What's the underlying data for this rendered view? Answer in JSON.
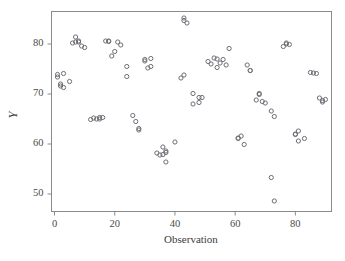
{
  "chart_data": {
    "type": "scatter",
    "title": "",
    "xlabel": "Observation",
    "ylabel": "Y",
    "xlim": [
      -1,
      92
    ],
    "ylim": [
      46.5,
      86.5
    ],
    "xticks": [
      0,
      20,
      40,
      60,
      80
    ],
    "yticks": [
      50,
      60,
      70,
      80
    ],
    "grid": false,
    "legend": null,
    "marker": "open-circle",
    "marker_color": "#6e6e76",
    "points": [
      {
        "x": 1,
        "y": 73.9
      },
      {
        "x": 1,
        "y": 73.4
      },
      {
        "x": 2,
        "y": 72.0
      },
      {
        "x": 2,
        "y": 71.6
      },
      {
        "x": 3,
        "y": 74.1
      },
      {
        "x": 3,
        "y": 71.3
      },
      {
        "x": 5,
        "y": 72.5
      },
      {
        "x": 6,
        "y": 80.2
      },
      {
        "x": 7,
        "y": 81.4
      },
      {
        "x": 7,
        "y": 80.4
      },
      {
        "x": 8,
        "y": 80.4
      },
      {
        "x": 8,
        "y": 80.6
      },
      {
        "x": 9,
        "y": 79.6
      },
      {
        "x": 10,
        "y": 79.3
      },
      {
        "x": 12,
        "y": 64.9
      },
      {
        "x": 13,
        "y": 65.2
      },
      {
        "x": 14,
        "y": 65.0
      },
      {
        "x": 15,
        "y": 65.0
      },
      {
        "x": 15,
        "y": 65.3
      },
      {
        "x": 16,
        "y": 65.3
      },
      {
        "x": 17,
        "y": 80.6
      },
      {
        "x": 18,
        "y": 80.5
      },
      {
        "x": 18,
        "y": 80.6
      },
      {
        "x": 19,
        "y": 77.6
      },
      {
        "x": 20,
        "y": 78.5
      },
      {
        "x": 21,
        "y": 80.4
      },
      {
        "x": 22,
        "y": 79.8
      },
      {
        "x": 24,
        "y": 75.5
      },
      {
        "x": 24,
        "y": 73.5
      },
      {
        "x": 26,
        "y": 65.7
      },
      {
        "x": 27,
        "y": 64.5
      },
      {
        "x": 28,
        "y": 63.1
      },
      {
        "x": 28,
        "y": 62.8
      },
      {
        "x": 30,
        "y": 76.9
      },
      {
        "x": 30,
        "y": 76.6
      },
      {
        "x": 31,
        "y": 75.2
      },
      {
        "x": 32,
        "y": 77.1
      },
      {
        "x": 32,
        "y": 75.5
      },
      {
        "x": 34,
        "y": 58.2
      },
      {
        "x": 35,
        "y": 57.8
      },
      {
        "x": 36,
        "y": 59.4
      },
      {
        "x": 36,
        "y": 57.9
      },
      {
        "x": 37,
        "y": 58.6
      },
      {
        "x": 37,
        "y": 58.3
      },
      {
        "x": 37,
        "y": 56.4
      },
      {
        "x": 40,
        "y": 60.4
      },
      {
        "x": 42,
        "y": 73.2
      },
      {
        "x": 43,
        "y": 85.2
      },
      {
        "x": 43,
        "y": 84.7
      },
      {
        "x": 43,
        "y": 73.8
      },
      {
        "x": 44,
        "y": 84.2
      },
      {
        "x": 46,
        "y": 70.1
      },
      {
        "x": 46,
        "y": 68.0
      },
      {
        "x": 48,
        "y": 69.3
      },
      {
        "x": 48,
        "y": 68.3
      },
      {
        "x": 49,
        "y": 69.3
      },
      {
        "x": 51,
        "y": 76.5
      },
      {
        "x": 52,
        "y": 76.0
      },
      {
        "x": 53,
        "y": 77.2
      },
      {
        "x": 54,
        "y": 77.0
      },
      {
        "x": 54,
        "y": 75.3
      },
      {
        "x": 55,
        "y": 76.2
      },
      {
        "x": 56,
        "y": 76.9
      },
      {
        "x": 57,
        "y": 75.8
      },
      {
        "x": 58,
        "y": 79.1
      },
      {
        "x": 61,
        "y": 61.2
      },
      {
        "x": 61,
        "y": 61.1
      },
      {
        "x": 62,
        "y": 61.6
      },
      {
        "x": 63,
        "y": 59.9
      },
      {
        "x": 64,
        "y": 75.8
      },
      {
        "x": 65,
        "y": 74.7
      },
      {
        "x": 65,
        "y": 74.7
      },
      {
        "x": 67,
        "y": 68.8
      },
      {
        "x": 68,
        "y": 70.1
      },
      {
        "x": 68,
        "y": 69.9
      },
      {
        "x": 69,
        "y": 68.5
      },
      {
        "x": 70,
        "y": 68.2
      },
      {
        "x": 72,
        "y": 66.6
      },
      {
        "x": 72,
        "y": 53.3
      },
      {
        "x": 73,
        "y": 65.5
      },
      {
        "x": 73,
        "y": 48.6
      },
      {
        "x": 76,
        "y": 79.5
      },
      {
        "x": 77,
        "y": 80.2
      },
      {
        "x": 77,
        "y": 80.0
      },
      {
        "x": 78,
        "y": 79.9
      },
      {
        "x": 80,
        "y": 61.9
      },
      {
        "x": 80,
        "y": 62.0
      },
      {
        "x": 81,
        "y": 60.6
      },
      {
        "x": 81,
        "y": 62.6
      },
      {
        "x": 83,
        "y": 61.1
      },
      {
        "x": 85,
        "y": 74.3
      },
      {
        "x": 86,
        "y": 74.2
      },
      {
        "x": 87,
        "y": 74.1
      },
      {
        "x": 88,
        "y": 69.2
      },
      {
        "x": 89,
        "y": 68.4
      },
      {
        "x": 89,
        "y": 68.7
      },
      {
        "x": 90,
        "y": 68.9
      }
    ]
  }
}
